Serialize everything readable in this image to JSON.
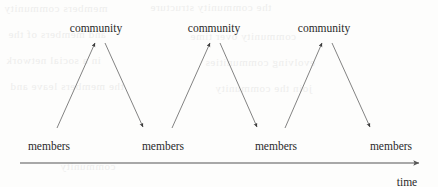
{
  "figure": {
    "background_color": "#fdfdfc",
    "ink_color": "#2a2a2a",
    "line_color": "#555555",
    "width": 438,
    "height": 187
  },
  "diagram": {
    "type": "cycle-timeline",
    "community_nodes": [
      {
        "label": "community",
        "x": 96,
        "y": 23
      },
      {
        "label": "community",
        "x": 214,
        "y": 23
      },
      {
        "label": "community",
        "x": 324,
        "y": 23
      }
    ],
    "members_nodes": [
      {
        "label": "members",
        "x": 49,
        "y": 141
      },
      {
        "label": "members",
        "x": 163,
        "y": 141
      },
      {
        "label": "members",
        "x": 276,
        "y": 141
      },
      {
        "label": "members",
        "x": 391,
        "y": 141
      }
    ],
    "arrows": [
      {
        "name": "members-to-community-1",
        "direction": "up",
        "x1": 57,
        "y1": 128,
        "x2": 95,
        "y2": 43
      },
      {
        "name": "community-to-members-1",
        "direction": "down",
        "x1": 105,
        "y1": 43,
        "x2": 143,
        "y2": 127
      },
      {
        "name": "members-to-community-2",
        "direction": "up",
        "x1": 172,
        "y1": 128,
        "x2": 210,
        "y2": 43
      },
      {
        "name": "community-to-members-2",
        "direction": "down",
        "x1": 220,
        "y1": 43,
        "x2": 257,
        "y2": 127
      },
      {
        "name": "members-to-community-3",
        "direction": "up",
        "x1": 285,
        "y1": 128,
        "x2": 322,
        "y2": 43
      },
      {
        "name": "community-to-members-3",
        "direction": "down",
        "x1": 332,
        "y1": 43,
        "x2": 370,
        "y2": 127
      }
    ],
    "axis": {
      "name": "time-axis",
      "label": "time",
      "label_x": 407,
      "label_y": 177,
      "x1": 20,
      "y1": 163,
      "x2": 419,
      "y2": 163,
      "arrowhead": "right"
    }
  },
  "bleed_through": {
    "note": "faint mirrored show-through text from the reverse side of the scanned page",
    "lines": [
      "members community",
      "the community structure",
      "and members of the",
      "community over time",
      "in a social network",
      "evolving communities",
      "the members leave and",
      "join the community",
      "community"
    ]
  }
}
